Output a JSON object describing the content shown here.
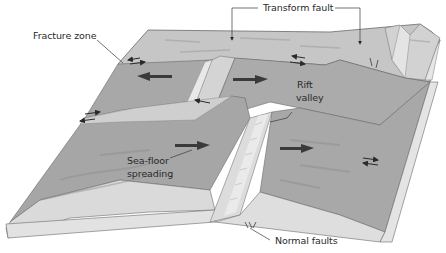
{
  "figure": {
    "colors": {
      "background": "#ffffff",
      "plate_top_dark": "#a8a8a8",
      "plate_top_light": "#c6c6c6",
      "plate_edge": "#dcdcdc",
      "ridge_wall": "#d8d8d8",
      "outline": "#6a6a6a",
      "arrow": "#3a3a3a",
      "leader": "#3a3a3a",
      "text": "#2a2a2a"
    }
  },
  "labels": {
    "transform_fault": "Transform fault",
    "fracture_zone": "Fracture zone",
    "rift_valley_line1": "Rift",
    "rift_valley_line2": "valley",
    "sea_floor_line1": "Sea-floor",
    "sea_floor_line2": "spreading",
    "normal_faults": "Normal faults"
  }
}
